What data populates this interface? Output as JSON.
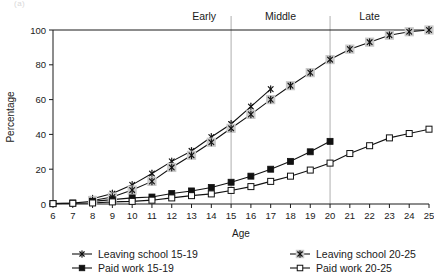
{
  "artifact_text": "(a)",
  "chart_data": {
    "type": "line",
    "title": "",
    "xlabel": "Age",
    "ylabel": "Percentage",
    "xlim": [
      6,
      25
    ],
    "ylim": [
      0,
      100
    ],
    "yticks": [
      0,
      20,
      40,
      60,
      80,
      100
    ],
    "xticks": [
      6,
      7,
      8,
      9,
      10,
      11,
      12,
      13,
      14,
      15,
      16,
      17,
      18,
      19,
      20,
      21,
      22,
      23,
      24,
      25
    ],
    "grid": "vertical-only",
    "legend_position": "below",
    "annotations": [
      {
        "label": "Early",
        "x": 15,
        "type": "phase-divider"
      },
      {
        "label": "Middle",
        "x": 20,
        "type": "phase-divider"
      },
      {
        "label": "Late",
        "x": 25,
        "type": "phase-label"
      }
    ],
    "vertical_gridlines": [
      15,
      20
    ],
    "x": [
      6,
      7,
      8,
      9,
      10,
      11,
      12,
      13,
      14,
      15,
      16,
      17,
      18,
      19,
      20,
      21,
      22,
      23,
      24,
      25
    ],
    "series": [
      {
        "name": "Leaving school 15-19",
        "marker": "star",
        "x": [
          8,
          9,
          10,
          11,
          12,
          13,
          14,
          15,
          16,
          17
        ],
        "values": [
          3,
          6,
          11,
          17.5,
          24.5,
          30.5,
          38.5,
          46,
          56,
          66
        ]
      },
      {
        "name": "Leaving school 20-25",
        "marker": "star-halo",
        "x": [
          8,
          9,
          10,
          11,
          12,
          13,
          14,
          15,
          16,
          17,
          18,
          19,
          20,
          21,
          22,
          23,
          24,
          25
        ],
        "values": [
          2,
          4,
          8,
          13,
          21,
          28,
          35.5,
          43.5,
          51.5,
          60,
          68,
          75.5,
          83,
          89,
          93,
          97,
          99,
          100
        ]
      },
      {
        "name": "Paid work 15-19",
        "marker": "square-filled",
        "x": [
          6,
          7,
          8,
          9,
          10,
          11,
          12,
          13,
          14,
          15,
          16,
          17,
          18,
          19,
          20
        ],
        "values": [
          0.3,
          0.6,
          1.5,
          2.5,
          3.5,
          4,
          6,
          7.5,
          9.5,
          12.5,
          16,
          20,
          24.5,
          30,
          36
        ]
      },
      {
        "name": "Paid work 20-25",
        "marker": "square-open",
        "x": [
          6,
          7,
          8,
          9,
          10,
          11,
          12,
          13,
          14,
          15,
          16,
          17,
          18,
          19,
          20,
          21,
          22,
          23,
          24,
          25
        ],
        "values": [
          0.2,
          0.4,
          0.6,
          1.2,
          1.5,
          2.2,
          3.5,
          4.8,
          5.8,
          7.8,
          10,
          13,
          16,
          19.5,
          23.5,
          29,
          33.5,
          38,
          40.5,
          43
        ]
      }
    ]
  },
  "legend": {
    "items": [
      {
        "label": "Leaving school 15-19",
        "marker": "star"
      },
      {
        "label": "Leaving school 20-25",
        "marker": "star-halo"
      },
      {
        "label": "Paid work 15-19",
        "marker": "square-filled"
      },
      {
        "label": "Paid work 20-25",
        "marker": "square-open"
      }
    ]
  }
}
